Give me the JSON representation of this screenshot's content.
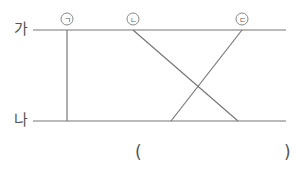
{
  "lines": {
    "top_label": "가",
    "bottom_label": "나"
  },
  "markers": [
    {
      "id": "a",
      "label": "ㄱ"
    },
    {
      "id": "b",
      "label": "ㄴ"
    },
    {
      "id": "c",
      "label": "ㄷ"
    }
  ],
  "answer": {
    "open": "(",
    "close": ")",
    "value": ""
  },
  "colors": {
    "stroke": "#777777",
    "text": "#555555"
  }
}
